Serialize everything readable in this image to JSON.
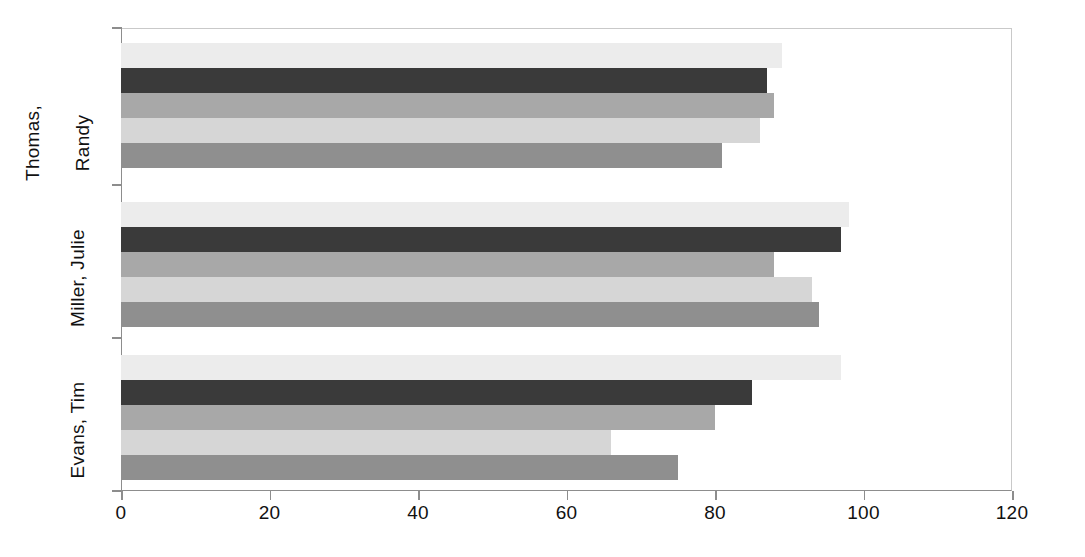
{
  "chart_data": {
    "type": "bar",
    "orientation": "horizontal",
    "title": "",
    "xlabel": "",
    "ylabel": "",
    "xlim": [
      0,
      120
    ],
    "xticks": [
      0,
      20,
      40,
      60,
      80,
      100,
      120
    ],
    "xtick_labels": [
      "0",
      "20",
      "40",
      "60",
      "80",
      "100",
      "120"
    ],
    "grid": false,
    "legend": "none",
    "categories": [
      "Thomas, Randy",
      "Miller, Julie",
      "Evans, Tim"
    ],
    "category_label_lines": [
      [
        "Thomas,",
        "Randy"
      ],
      [
        "Miller, Julie"
      ],
      [
        "Evans, Tim"
      ]
    ],
    "series": [
      {
        "name": "series-1",
        "color": "#ececec",
        "values": [
          89,
          98,
          97
        ]
      },
      {
        "name": "series-2",
        "color": "#3a3a3a",
        "values": [
          87,
          97,
          85
        ]
      },
      {
        "name": "series-3",
        "color": "#a8a8a8",
        "values": [
          88,
          88,
          80
        ]
      },
      {
        "name": "series-4",
        "color": "#d6d6d6",
        "values": [
          86,
          93,
          66
        ]
      },
      {
        "name": "series-5",
        "color": "#8f8f8f",
        "values": [
          81,
          94,
          75
        ]
      }
    ]
  },
  "axis": {
    "plot_background": "#ffffff",
    "axis_line_color": "#8d8d8d",
    "frame_color": "#c9c9c9",
    "tick_text_color": "#111111"
  }
}
